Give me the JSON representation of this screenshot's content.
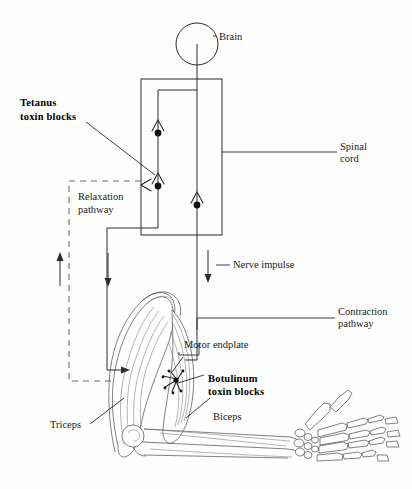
{
  "figure": {
    "labels": {
      "brain": "Brain",
      "spinal_cord": "Spinal\ncord",
      "spinal_cord_line1": "Spinal",
      "spinal_cord_line2": "cord",
      "tetanus_line1": "Tetanus",
      "tetanus_line2": "toxin blocks",
      "relaxation_line1": "Relaxation",
      "relaxation_line2": "pathway",
      "nerve_impulse": "Nerve impulse",
      "contraction_line1": "Contraction",
      "contraction_line2": "pathway",
      "motor_endplate": "Motor endplate",
      "botulinum_line1": "Botulinum",
      "botulinum_line2": "toxin blocks",
      "triceps": "Triceps",
      "biceps": "Biceps"
    },
    "icons": {
      "brain_circle": "brain-circle-icon",
      "synapse_marker": "synapse-terminal-icon",
      "arrow_up": "arrow-up-icon",
      "arrow_down": "arrow-down-icon",
      "endplate_burst": "motor-endplate-burst-icon"
    },
    "colors": {
      "ink": "#2b2b2b",
      "ink_bold": "#000000",
      "dashed": "#6b6b6b",
      "anatomy": "#4a4a4a",
      "background": "#fefefe"
    }
  }
}
